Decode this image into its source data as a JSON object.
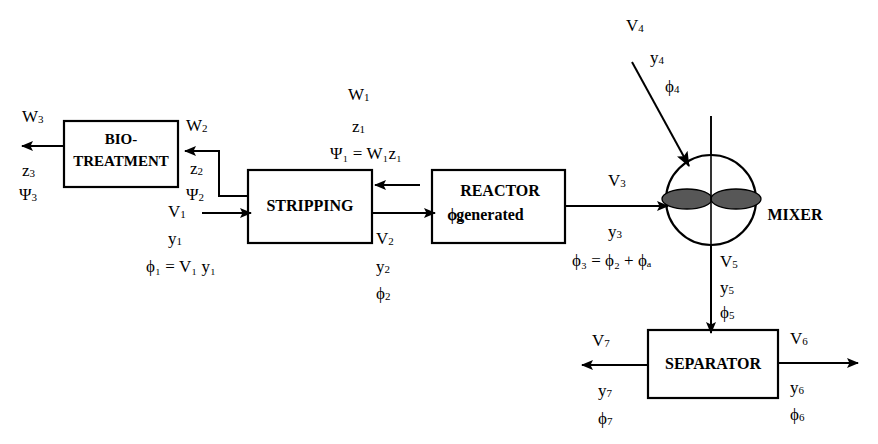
{
  "diagram": {
    "colors": {
      "line": "#000000",
      "box_fill": "#ffffff",
      "impeller_fill": "#575757",
      "background": "#ffffff"
    },
    "units": [
      {
        "id": "bio-treatment",
        "label_line1": "BIO-",
        "label_line2": "TREATMENT",
        "shape": "rectangle"
      },
      {
        "id": "stripping",
        "label": "STRIPPING",
        "shape": "rectangle"
      },
      {
        "id": "reactor",
        "label_line1": "REACTOR",
        "label_line2_sym": "ϕ",
        "label_line2_sub": "a",
        "label_line2_text": "generated",
        "shape": "rectangle"
      },
      {
        "id": "mixer",
        "label": "MIXER",
        "shape": "circle-with-impeller"
      },
      {
        "id": "separator",
        "label": "SEPARATOR",
        "shape": "rectangle"
      }
    ],
    "streams": {
      "s3_bio_out": {
        "flow": "W",
        "flow_sub": "3",
        "comp": "z",
        "comp_sub": "3",
        "load": "Ψ",
        "load_sub": "3"
      },
      "s2_recycle": {
        "flow": "W",
        "flow_sub": "2",
        "comp": "z",
        "comp_sub": "2",
        "load": "Ψ",
        "load_sub": "2"
      },
      "s1_feed": {
        "flow": "V",
        "flow_sub": "1",
        "comp": "y",
        "comp_sub": "1",
        "load_eq": "ϕ₁ = V₁ y₁"
      },
      "s1_strip": {
        "flow": "W",
        "flow_sub": "1",
        "comp": "z",
        "comp_sub": "1",
        "load_eq": "Ψ₁ = W₁z₁"
      },
      "s2_strip_out": {
        "flow": "V",
        "flow_sub": "2",
        "comp": "y",
        "comp_sub": "2",
        "load": "ϕ",
        "load_sub": "2"
      },
      "s3_reactor_out": {
        "flow": "V",
        "flow_sub": "3",
        "comp": "y",
        "comp_sub": "3",
        "load_eq": "ϕ₃ = ϕ₂ + ϕₐ"
      },
      "s4_mixer_in": {
        "flow": "V",
        "flow_sub": "4",
        "comp": "y",
        "comp_sub": "4",
        "load": "ϕ",
        "load_sub": "4"
      },
      "s5_mixer_out": {
        "flow": "V",
        "flow_sub": "5",
        "comp": "y",
        "comp_sub": "5",
        "load": "ϕ",
        "load_sub": "5"
      },
      "s6_sep_right": {
        "flow": "V",
        "flow_sub": "6",
        "comp": "y",
        "comp_sub": "6",
        "load": "ϕ",
        "load_sub": "6"
      },
      "s7_sep_left": {
        "flow": "V",
        "flow_sub": "7",
        "comp": "y",
        "comp_sub": "7",
        "load": "ϕ",
        "load_sub": "7"
      }
    },
    "text": {
      "bio_line1": "BIO-",
      "bio_line2": "TREATMENT",
      "stripping": "STRIPPING",
      "reactor": "REACTOR",
      "reactor_generated": "generated",
      "reactor_phi_a": "ϕ",
      "reactor_phi_a_sub": "a",
      "mixer": "MIXER",
      "separator": "SEPARATOR",
      "W3": "W",
      "W3_sub": "3",
      "z3": "z",
      "z3_sub": "3",
      "Psi3": "Ψ",
      "Psi3_sub": "3",
      "W2": "W",
      "W2_sub": "2",
      "z2": "z",
      "z2_sub": "2",
      "Psi2": "Ψ",
      "Psi2_sub": "2",
      "V1": "V",
      "V1_sub": "1",
      "y1": "y",
      "y1_sub": "1",
      "phi1_eq": "ϕ₁ = V₁ y₁",
      "W1": "W",
      "W1_sub": "1",
      "z1": "z",
      "z1_sub": "1",
      "Psi1_eq": "Ψ₁ = W₁z₁",
      "V2": "V",
      "V2_sub": "2",
      "y2": "y",
      "y2_sub": "2",
      "phi2": "ϕ",
      "phi2_sub": "2",
      "V3": "V",
      "V3_sub": "3",
      "y3": "y",
      "y3_sub": "3",
      "phi3_eq": "ϕ₃ = ϕ₂ + ϕₐ",
      "V4": "V",
      "V4_sub": "4",
      "y4": "y",
      "y4_sub": "4",
      "phi4": "ϕ",
      "phi4_sub": "4",
      "V5": "V",
      "V5_sub": "5",
      "y5": "y",
      "y5_sub": "5",
      "phi5": "ϕ",
      "phi5_sub": "5",
      "V6": "V",
      "V6_sub": "6",
      "y6": "y",
      "y6_sub": "6",
      "phi6": "ϕ",
      "phi6_sub": "6",
      "V7": "V",
      "V7_sub": "7",
      "y7": "y",
      "y7_sub": "7",
      "phi7": "ϕ",
      "phi7_sub": "7"
    }
  }
}
